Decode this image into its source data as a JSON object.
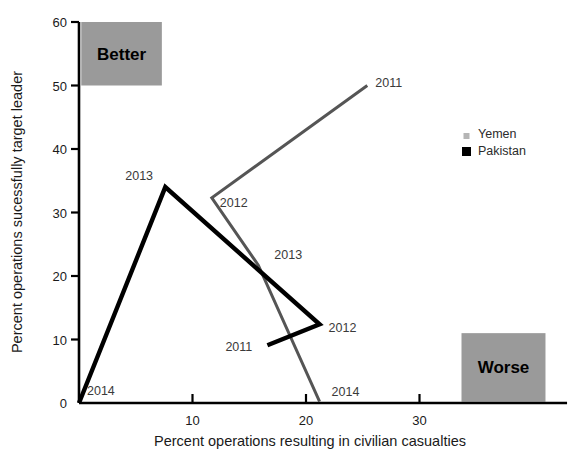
{
  "chart_data": {
    "type": "line",
    "title": "",
    "xlabel": "Percent operations resulting in civilian casualties",
    "ylabel": "Percent operations sucessfully target leader",
    "xlim": [
      0,
      43
    ],
    "ylim": [
      0,
      60
    ],
    "xticks": [
      0,
      10,
      20,
      30
    ],
    "yticks": [
      0,
      10,
      20,
      30,
      40,
      50,
      60
    ],
    "xtick_labels": [
      "0",
      "10",
      "20",
      "30"
    ],
    "ytick_labels": [
      "0",
      "10",
      "20",
      "30",
      "40",
      "50",
      "60"
    ],
    "grid": false,
    "legend_position": "right",
    "series": [
      {
        "name": "Yemen",
        "color": "#555555",
        "points": [
          {
            "label": "2011",
            "x": 25.4,
            "y": 50.0,
            "label_dx": 8,
            "label_dy": 1
          },
          {
            "label": "2012",
            "x": 11.7,
            "y": 32.3,
            "label_dx": 8,
            "label_dy": 9
          },
          {
            "label": "2013",
            "x": 15.8,
            "y": 21.7,
            "label_dx": 16,
            "label_dy": -6
          },
          {
            "label": "2014",
            "x": 21.2,
            "y": 0.2,
            "label_dx": 12,
            "label_dy": -6
          }
        ]
      },
      {
        "name": "Pakistan",
        "color": "#000000",
        "points": [
          {
            "label": "2011",
            "x": 16.6,
            "y": 9.1,
            "label_dx": -42,
            "label_dy": 6
          },
          {
            "label": "2012",
            "x": 21.2,
            "y": 12.4,
            "label_dx": 9,
            "label_dy": 8
          },
          {
            "label": "2013",
            "x": 7.6,
            "y": 34.0,
            "label_dx": -40,
            "label_dy": -7
          },
          {
            "label": "2014",
            "x": 0.0,
            "y": 0.0,
            "label_dx": 8,
            "label_dy": -8
          }
        ]
      }
    ],
    "annotations": [
      {
        "name": "better-zone",
        "text": "Better",
        "x0": 0.2,
        "y0": 50.0,
        "x1": 7.3,
        "y1": 60.0,
        "fill": "#9a9a9a"
      },
      {
        "name": "worse-zone",
        "text": "Worse",
        "x0": 33.7,
        "y0": 0.2,
        "x1": 41.1,
        "y1": 11.0,
        "fill": "#9a9a9a"
      }
    ]
  },
  "legend": {
    "items": [
      {
        "name": "Yemen",
        "color": "#b5b5b5",
        "size": 6
      },
      {
        "name": "Pakistan",
        "color": "#000000",
        "size": 9
      }
    ]
  },
  "axis": {
    "xlabel": "Percent operations resulting in civilian casualties",
    "ylabel": "Percent operations sucessfully target leader"
  },
  "zones": {
    "better": "Better",
    "worse": "Worse"
  }
}
